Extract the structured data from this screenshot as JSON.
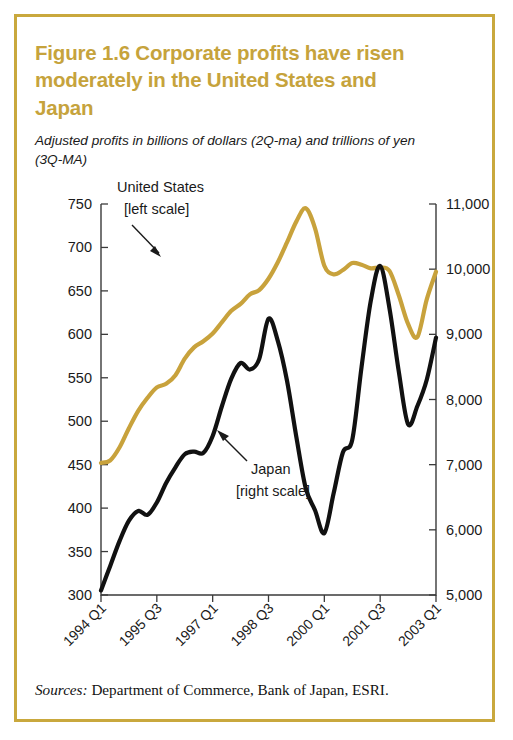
{
  "figure": {
    "title": "Figure 1.6  Corporate profits have risen moderately in the United States and Japan",
    "subtitle": "Adjusted profits in billions of dollars (2Q-ma) and trillions of yen (3Q-MA)",
    "source_label": "Sources:",
    "source_text": " Department of Commerce, Bank of Japan, ESRI.",
    "border_color": "#c9a83d",
    "title_color": "#c6a33c"
  },
  "chart_data": {
    "type": "line",
    "title": "Figure 1.6  Corporate profits have risen moderately in the United States and Japan",
    "subtitle": "Adjusted profits in billions of dollars (2Q-ma) and trillions of yen (3Q-MA)",
    "xlabel": "",
    "ylabel": "",
    "grid": false,
    "legend": "inline-annotations",
    "x_tick_labels": [
      "1994 Q1",
      "1995 Q3",
      "1997 Q1",
      "1998 Q3",
      "2000 Q1",
      "2001 Q3",
      "2003 Q1"
    ],
    "x_tick_index": [
      0,
      6,
      12,
      18,
      24,
      30,
      36
    ],
    "x_quarters": [
      "1994 Q1",
      "1994 Q2",
      "1994 Q3",
      "1994 Q4",
      "1995 Q1",
      "1995 Q2",
      "1995 Q3",
      "1995 Q4",
      "1996 Q1",
      "1996 Q2",
      "1996 Q3",
      "1996 Q4",
      "1997 Q1",
      "1997 Q2",
      "1997 Q3",
      "1997 Q4",
      "1998 Q1",
      "1998 Q2",
      "1998 Q3",
      "1998 Q4",
      "1999 Q1",
      "1999 Q2",
      "1999 Q3",
      "1999 Q4",
      "2000 Q1",
      "2000 Q2",
      "2000 Q3",
      "2000 Q4",
      "2001 Q1",
      "2001 Q2",
      "2001 Q3",
      "2001 Q4",
      "2002 Q1",
      "2002 Q2",
      "2002 Q3",
      "2002 Q4",
      "2003 Q1"
    ],
    "axes": {
      "left": {
        "label": "Adjusted profits in billions of dollars (2Q-ma)",
        "ticks": [
          300,
          350,
          400,
          450,
          500,
          550,
          600,
          650,
          700,
          750
        ],
        "tick_labels": [
          "300",
          "350",
          "400",
          "450",
          "500",
          "550",
          "600",
          "650",
          "700",
          "750"
        ],
        "ylim": [
          300,
          750
        ]
      },
      "right": {
        "label": "Trillions of yen (3Q-MA)",
        "ticks": [
          5000,
          6000,
          7000,
          8000,
          9000,
          10000,
          11000
        ],
        "tick_labels": [
          "5,000",
          "6,000",
          "7,000",
          "8,000",
          "9,000",
          "10,000",
          "11,000"
        ],
        "ylim": [
          5000,
          11000
        ]
      }
    },
    "series": [
      {
        "name": "United States",
        "axis": "left",
        "color": "#c8a23c",
        "annotation": "United States",
        "annotation_line2": "[left scale]",
        "values": [
          452,
          455,
          470,
          492,
          512,
          527,
          539,
          543,
          553,
          572,
          585,
          592,
          601,
          614,
          627,
          635,
          646,
          651,
          664,
          683,
          706,
          730,
          745,
          722,
          679,
          669,
          674,
          682,
          680,
          676,
          677,
          673,
          645,
          612,
          597,
          640,
          672
        ]
      },
      {
        "name": "Japan",
        "axis": "right",
        "color": "#111111",
        "annotation": "Japan",
        "annotation_line2": "[right scale]",
        "values": [
          5070,
          5450,
          5830,
          6140,
          6290,
          6230,
          6420,
          6720,
          6960,
          7160,
          7200,
          7180,
          7440,
          7900,
          8320,
          8560,
          8460,
          8620,
          9240,
          8900,
          8280,
          7420,
          6640,
          6300,
          5950,
          6560,
          7190,
          7380,
          8500,
          9520,
          10050,
          9400,
          8430,
          7620,
          7900,
          8300,
          8950
        ]
      }
    ],
    "annotations": [
      {
        "text": "United States",
        "text_line2": "[left scale]",
        "arrow": "down-right",
        "points_to_series": "United States"
      },
      {
        "text": "Japan",
        "text_line2": "[right scale]",
        "arrow": "up-left",
        "points_to_series": "Japan"
      }
    ]
  }
}
